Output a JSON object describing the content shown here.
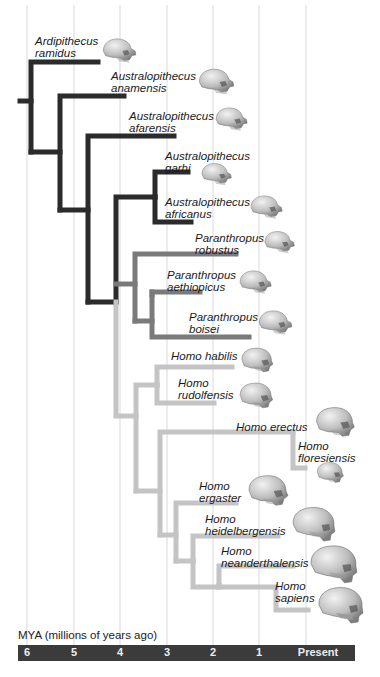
{
  "figure": {
    "axis_caption": "MYA (millions of years ago)",
    "ticks": [
      {
        "label": "6",
        "x": 27
      },
      {
        "label": "5",
        "x": 74
      },
      {
        "label": "4",
        "x": 120
      },
      {
        "label": "3",
        "x": 167
      },
      {
        "label": "2",
        "x": 213
      },
      {
        "label": "1",
        "x": 259
      },
      {
        "label": "Present",
        "x": 318
      }
    ],
    "gridlines_x": [
      27,
      74,
      120,
      167,
      213,
      259,
      306
    ],
    "colors": {
      "ardipithecus_australopithecus": "#2b2b2b",
      "paranthropus": "#7a7a7a",
      "homo": "#c4c4c4",
      "gridline": "#d9d9d9",
      "axis_bar": "#3b3b3b"
    }
  },
  "taxa": [
    {
      "genus": "Ardipithecus",
      "species": "ramidus",
      "label_x": 35,
      "label_y": 35,
      "skull_x": 100,
      "skull_y": 35,
      "skull_w": 40,
      "skull_type": "ape"
    },
    {
      "genus": "Australopithecus",
      "species": "anamensis",
      "label_x": 111,
      "label_y": 70,
      "skull_x": 196,
      "skull_y": 65,
      "skull_w": 42,
      "skull_type": "ape"
    },
    {
      "genus": "Australopithecus",
      "species": "afarensis",
      "label_x": 129,
      "label_y": 110,
      "skull_x": 213,
      "skull_y": 104,
      "skull_w": 38,
      "skull_type": "ape"
    },
    {
      "genus": "Australopithecus",
      "species": "garhi",
      "label_x": 165,
      "label_y": 150,
      "skull_x": 199,
      "skull_y": 160,
      "skull_w": 36,
      "skull_type": "ape"
    },
    {
      "genus": "Australopithecus",
      "species": "africanus",
      "label_x": 165,
      "label_y": 196,
      "skull_x": 248,
      "skull_y": 192,
      "skull_w": 38,
      "skull_type": "ape"
    },
    {
      "genus": "Paranthropus",
      "species": "robustus",
      "label_x": 195,
      "label_y": 232,
      "skull_x": 262,
      "skull_y": 228,
      "skull_w": 36,
      "skull_type": "robust"
    },
    {
      "genus": "Paranthropus",
      "species": "aethiopicus",
      "label_x": 167,
      "label_y": 269,
      "skull_x": 237,
      "skull_y": 267,
      "skull_w": 38,
      "skull_type": "robust"
    },
    {
      "genus": "Paranthropus",
      "species": "boisei",
      "label_x": 189,
      "label_y": 311,
      "skull_x": 256,
      "skull_y": 307,
      "skull_w": 40,
      "skull_type": "robust"
    },
    {
      "genus": "Homo",
      "species": "habilis",
      "label_x": 171,
      "label_y": 350,
      "skull_x": 238,
      "skull_y": 345,
      "skull_w": 38,
      "skull_type": "homo"
    },
    {
      "genus": "Homo",
      "species": "rudolfensis",
      "label_x": 178,
      "label_y": 377,
      "skull_x": 236,
      "skull_y": 380,
      "skull_w": 40,
      "skull_type": "homo"
    },
    {
      "genus": "Homo",
      "species": "erectus",
      "label_x": 236,
      "label_y": 421,
      "skull_x": 312,
      "skull_y": 404,
      "skull_w": 46,
      "skull_type": "homo"
    },
    {
      "genus": "Homo",
      "species": "floresiensis",
      "label_x": 298,
      "label_y": 440,
      "skull_x": 314,
      "skull_y": 460,
      "skull_w": 32,
      "skull_type": "homo"
    },
    {
      "genus": "Homo",
      "species": "ergaster",
      "label_x": 199,
      "label_y": 480,
      "skull_x": 244,
      "skull_y": 472,
      "skull_w": 48,
      "skull_type": "homo"
    },
    {
      "genus": "Homo",
      "species": "heidelbergensis",
      "label_x": 205,
      "label_y": 513,
      "skull_x": 290,
      "skull_y": 505,
      "skull_w": 48,
      "skull_type": "modern"
    },
    {
      "genus": "Homo",
      "species": "neanderthalensis",
      "label_x": 221,
      "label_y": 545,
      "skull_x": 308,
      "skull_y": 543,
      "skull_w": 52,
      "skull_type": "modern"
    },
    {
      "genus": "Homo",
      "species": "sapiens",
      "label_x": 275,
      "label_y": 580,
      "skull_x": 316,
      "skull_y": 585,
      "skull_w": 50,
      "skull_type": "sapiens"
    }
  ]
}
